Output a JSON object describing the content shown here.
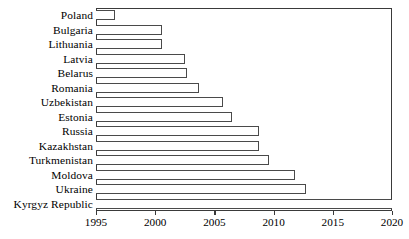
{
  "chart_data": {
    "type": "bar",
    "orientation": "horizontal",
    "title": "",
    "xlabel": "",
    "ylabel": "",
    "xlim": [
      1995,
      2020
    ],
    "xticks": [
      1995,
      2000,
      2005,
      2010,
      2015,
      2020
    ],
    "xtick_labels": [
      "1995",
      "2000",
      "2005",
      "2010",
      "2015",
      "2020"
    ],
    "grid": false,
    "legend": false,
    "categories": [
      "Poland",
      "Bulgaria",
      "Lithuania",
      "Latvia",
      "Belarus",
      "Romania",
      "Uzbekistan",
      "Estonia",
      "Russia",
      "Kazakhstan",
      "Turkmenistan",
      "Moldova",
      "Ukraine",
      "Kyrgyz Republic"
    ],
    "values": [
      1996.6,
      2000.6,
      2000.6,
      2002.5,
      2002.7,
      2003.7,
      2005.7,
      2006.5,
      2008.8,
      2008.8,
      2009.6,
      2011.8,
      2012.7,
      2020.0
    ],
    "bar_style": {
      "fill": "#ffffff",
      "edge": "#4a4a4a",
      "frame": "#3a3a3a"
    }
  }
}
